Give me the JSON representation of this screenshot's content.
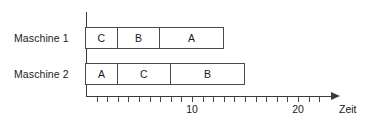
{
  "chart_data": {
    "type": "bar",
    "chart_subtype": "gantt",
    "title": "",
    "xlabel": "Zeit",
    "ylabel": "",
    "xlim": [
      0,
      23.3
    ],
    "grid": false,
    "legend": false,
    "axis_arrow": true,
    "tick_interval": 1,
    "tick_values": [
      1,
      2,
      3,
      4,
      5,
      6,
      7,
      8,
      9,
      10,
      11,
      12,
      13,
      14,
      15,
      16,
      17,
      18,
      19,
      20,
      21,
      22
    ],
    "labeled_ticks": [
      {
        "value": 10,
        "label": "10"
      },
      {
        "value": 20,
        "label": "20"
      }
    ],
    "rows": [
      {
        "label": "Maschine 1",
        "tasks": [
          {
            "name": "C",
            "start": 0,
            "end": 3
          },
          {
            "name": "B",
            "start": 3,
            "end": 7
          },
          {
            "name": "A",
            "start": 7,
            "end": 13
          }
        ]
      },
      {
        "label": "Maschine 2",
        "tasks": [
          {
            "name": "A",
            "start": 0,
            "end": 3
          },
          {
            "name": "C",
            "start": 3,
            "end": 8
          },
          {
            "name": "B",
            "start": 8,
            "end": 15
          }
        ]
      }
    ],
    "colors": {
      "axis": "#3a3a3a",
      "task_border": "#4a4a4a",
      "task_fill": "#ffffff",
      "text": "#1a1a1a",
      "background": "#ffffff"
    }
  }
}
